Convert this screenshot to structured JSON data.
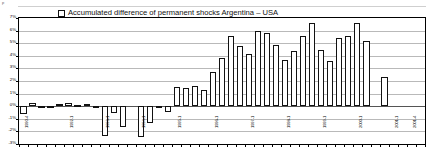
{
  "legend": {
    "label": "Accumulated difference of permanent shocks Argentina – USA",
    "marker": "open-square"
  },
  "corner_note": "p",
  "chart_data": {
    "type": "bar",
    "title": "",
    "subtitle": "",
    "xlabel": "",
    "ylabel": "",
    "ylim": [
      -3,
      7
    ],
    "yticks": [
      7,
      6,
      5,
      4,
      3,
      2,
      1,
      0,
      -1,
      -2,
      -3
    ],
    "ytick_labels": [
      "7%",
      "6%",
      "5%",
      "4%",
      "3%",
      "2%",
      "1%",
      "0%",
      "-1%",
      "-2%",
      "-3%"
    ],
    "grid": true,
    "legend_position": "top-center",
    "series_name": "Accumulated difference of permanent shocks Argentina – USA",
    "categories": [
      "1990-4",
      "1991-1",
      "1991-2",
      "1991-3",
      "1991-4",
      "1992-1",
      "1992-2",
      "1992-3",
      "1992-4",
      "1993-1",
      "1993-2",
      "1993-3",
      "1993-4",
      "1994-1",
      "1994-2",
      "1994-3",
      "1994-4",
      "1995-1",
      "1995-2",
      "1995-3",
      "1995-4",
      "1996-1",
      "1996-2",
      "1996-3",
      "1996-4",
      "1997-1",
      "1997-2",
      "1997-3",
      "1997-4",
      "1998-1",
      "1998-2",
      "1998-3",
      "1998-4",
      "1999-1",
      "1999-2",
      "1999-3",
      "1999-4",
      "2000-1",
      "2000-2",
      "2000-3",
      "2000-4",
      "2001-1",
      "2001-2",
      "2001-3",
      "2001-4"
    ],
    "visible_tick_labels": [
      {
        "index": 0,
        "label": "1990-4"
      },
      {
        "index": 5,
        "label": "1992-1"
      },
      {
        "index": 9,
        "label": "1993-1"
      },
      {
        "index": 13,
        "label": "1994-1"
      },
      {
        "index": 17,
        "label": "1995-1"
      },
      {
        "index": 21,
        "label": "1996-1"
      },
      {
        "index": 25,
        "label": "1997-1"
      },
      {
        "index": 29,
        "label": "1998-1"
      },
      {
        "index": 33,
        "label": "1999-1"
      },
      {
        "index": 37,
        "label": "2000-1"
      },
      {
        "index": 41,
        "label": "2001-1"
      },
      {
        "index": 43,
        "label": "2001-4"
      }
    ],
    "values": [
      -0.65,
      0.22,
      0.05,
      0.05,
      0.18,
      0.25,
      0.12,
      0.17,
      -0.12,
      -2.35,
      -0.58,
      -1.65,
      0.0,
      -2.45,
      -1.35,
      -0.05,
      -0.45,
      1.55,
      1.42,
      1.62,
      1.25,
      2.75,
      3.85,
      5.55,
      4.8,
      4.15,
      6.0,
      5.8,
      4.85,
      3.7,
      4.35,
      5.55,
      6.6,
      4.45,
      3.6,
      5.45,
      5.55,
      6.6,
      5.2,
      0.0,
      2.3,
      0.0,
      0.0,
      0.0,
      0.0
    ],
    "units": "%"
  }
}
